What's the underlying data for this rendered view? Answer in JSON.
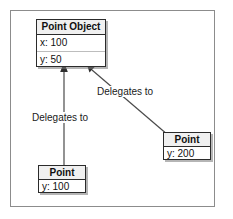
{
  "diagram": {
    "type": "object-delegation-diagram",
    "background_color": "#ffffff",
    "frame_border_color": "#8c8c8c",
    "connector_color": "#4a4a4a",
    "box_border_color": "#2b2b2b",
    "box_header_fill": "#f0f0f0",
    "boxes": [
      {
        "id": "point-object",
        "title": "Point Object",
        "fields": [
          {
            "label": "x: 100"
          },
          {
            "label": "y: 50"
          }
        ]
      },
      {
        "id": "point-left",
        "title": "Point",
        "fields": [
          {
            "label": "y: 100"
          }
        ]
      },
      {
        "id": "point-right",
        "title": "Point",
        "fields": [
          {
            "label": "y: 200"
          }
        ]
      }
    ],
    "edges": [
      {
        "id": "edge-left",
        "label": "Delegates to",
        "from": "point-left",
        "to": "point-object"
      },
      {
        "id": "edge-right",
        "label": "Delegates to",
        "from": "point-right",
        "to": "point-object"
      }
    ]
  }
}
